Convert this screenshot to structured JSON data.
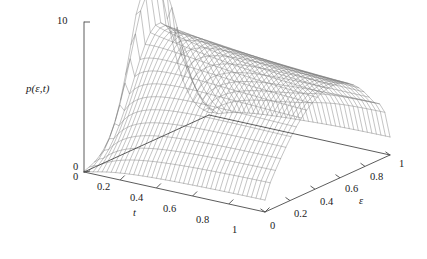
{
  "figure": {
    "type": "3d-surface-wireframe",
    "background": "#ffffff",
    "mesh_color": "#7a7a7a",
    "axis_color": "#4a4a4a"
  },
  "axes": {
    "z": {
      "label": "p(ε,t)",
      "ticks": [
        "0",
        "10"
      ],
      "tick_values": [
        0,
        10
      ],
      "min": 0,
      "max": 10
    },
    "t": {
      "label": "t",
      "ticks": [
        "0",
        "0.2",
        "0.4",
        "0.6",
        "0.8",
        "1"
      ],
      "tick_values": [
        0,
        0.2,
        0.4,
        0.6,
        0.8,
        1
      ],
      "min": 0,
      "max": 1
    },
    "epsilon": {
      "label": "ε",
      "ticks": [
        "0",
        "0.2",
        "0.4",
        "0.6",
        "0.8",
        "1"
      ],
      "tick_values": [
        0,
        0.2,
        0.4,
        0.6,
        0.8,
        1
      ],
      "min": 0,
      "max": 1
    }
  },
  "chart_data": {
    "type": "surface",
    "title": "",
    "xlabel": "t",
    "ylabel": "ε",
    "zlabel": "p(ε,t)",
    "xlim": [
      0,
      1
    ],
    "ylim": [
      0,
      1
    ],
    "zlim": [
      0,
      10
    ],
    "grid": false,
    "legend": "none",
    "nx": 41,
    "ny": 25,
    "x": [
      0,
      0.025,
      0.05,
      0.075,
      0.1,
      0.125,
      0.15,
      0.175,
      0.2,
      0.225,
      0.25,
      0.275,
      0.3,
      0.325,
      0.35,
      0.375,
      0.4,
      0.425,
      0.45,
      0.475,
      0.5,
      0.525,
      0.55,
      0.575,
      0.6,
      0.625,
      0.65,
      0.675,
      0.7,
      0.725,
      0.75,
      0.775,
      0.8,
      0.825,
      0.85,
      0.875,
      0.9,
      0.925,
      0.95,
      0.975,
      1
    ],
    "y": [
      0,
      0.0417,
      0.0833,
      0.125,
      0.1667,
      0.2083,
      0.25,
      0.2917,
      0.3333,
      0.375,
      0.4167,
      0.4583,
      0.5,
      0.5417,
      0.5833,
      0.625,
      0.6667,
      0.7083,
      0.75,
      0.7917,
      0.8333,
      0.875,
      0.9167,
      0.9583,
      1
    ],
    "peak_ridge": {
      "comment": "height of the dominant ridge as a function of t",
      "t": [
        0.02,
        0.06,
        0.1,
        0.15,
        0.2,
        0.3,
        0.4,
        0.5,
        0.6,
        0.7,
        0.8,
        0.9,
        1.0
      ],
      "z": [
        9.2,
        6.2,
        5.2,
        4.8,
        4.6,
        4.5,
        4.4,
        4.3,
        4.2,
        4.1,
        4.0,
        3.9,
        3.8
      ]
    },
    "secondary_fold": {
      "comment": "fold/ridge near epsilon = 1 at large t",
      "epsilon": 0.94,
      "t_range": [
        0.55,
        1.0
      ],
      "z": 3.4
    }
  }
}
